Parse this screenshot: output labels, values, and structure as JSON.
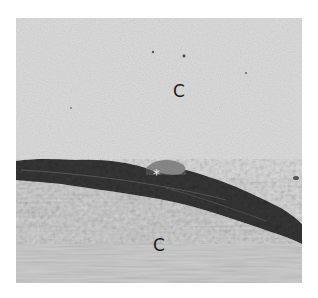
{
  "figure": {
    "type": "electron-micrograph",
    "labels": [
      {
        "id": "upper",
        "text": "C",
        "x": 166,
        "y": 90
      },
      {
        "id": "lower",
        "text": "C",
        "x": 147,
        "y": 236
      },
      {
        "id": "marker",
        "text": "*",
        "x": 151,
        "y": 165
      }
    ],
    "colors": {
      "upper_region": "#d8d8d8",
      "lower_region": "#cfcfcf",
      "cell_band": "#3a3a3a",
      "cell_band_dark": "#262626",
      "background": "#ffffff"
    }
  }
}
